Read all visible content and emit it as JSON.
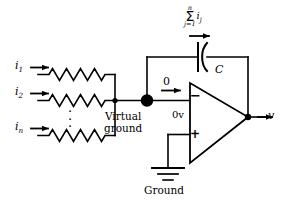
{
  "figure": {
    "line_color": "#000000",
    "background_color": "#ffffff"
  },
  "inputs": {
    "branches": [
      {
        "current_label": "i",
        "subscript": "1",
        "component": "resistor"
      },
      {
        "current_label": "i",
        "subscript": "2",
        "component": "resistor"
      },
      {
        "current_label": "i",
        "subscript": "n",
        "component": "resistor"
      }
    ],
    "ellipsis": "⋮"
  },
  "nodes": {
    "virtual_ground_label_line1": "Virtual",
    "virtual_ground_label_line2": "ground",
    "zero_current_label": "0",
    "input_offset_label": "0v"
  },
  "opamp": {
    "inverting_label": "−",
    "noninverting_label": "+"
  },
  "feedback": {
    "capacitor_label": "C",
    "current_sum": {
      "upper_limit": "n",
      "sigma": "Σ",
      "lower_limit": "j=1",
      "term": "i",
      "term_subscript": "j"
    }
  },
  "output": {
    "label": "v"
  },
  "ground": {
    "label": "Ground"
  }
}
